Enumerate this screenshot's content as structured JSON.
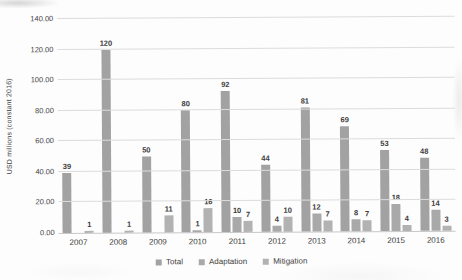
{
  "chart_data": {
    "type": "bar",
    "title": "",
    "xlabel": "",
    "ylabel": "USD millions (constant 2016)",
    "categories": [
      "2007",
      "2008",
      "2009",
      "2010",
      "2011",
      "2012",
      "2013",
      "2014",
      "2015",
      "2016"
    ],
    "series": [
      {
        "name": "Total",
        "color": "#a2a2a2",
        "values": [
          39,
          120,
          50,
          80,
          92,
          44,
          81,
          69,
          53,
          48
        ]
      },
      {
        "name": "Adaptation",
        "color": "#a9a9a9",
        "values": [
          null,
          null,
          null,
          1,
          10,
          4,
          12,
          8,
          18,
          14
        ]
      },
      {
        "name": "Mitigation",
        "color": "#b2b2b2",
        "values": [
          1,
          1,
          11,
          16,
          7,
          10,
          7,
          7,
          4,
          3
        ]
      }
    ],
    "ylim": [
      0,
      140
    ],
    "yticks": [
      0,
      20,
      40,
      60,
      80,
      100,
      120,
      140
    ],
    "ytick_labels": [
      "0.00",
      "20.00",
      "40.00",
      "60.00",
      "80.00",
      "100.00",
      "120.00",
      "140.00"
    ],
    "grid": true,
    "bar_value_labels": true,
    "legend_position": "bottom"
  },
  "colors": {
    "grid": "#dcdcdc",
    "axis": "#c8c8c8",
    "text": "#3d3d3d"
  }
}
